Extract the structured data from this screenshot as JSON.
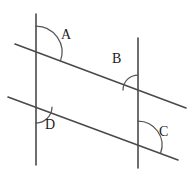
{
  "figure": {
    "kind": "geometry-diagram",
    "width": 193,
    "height": 178,
    "background_color": "#ffffff",
    "line_color": "#4a4a4a",
    "arc_color": "#555555",
    "label_color": "#1a1a1a"
  },
  "lines": [
    {
      "id": "left-vertical",
      "name": "left vertical line",
      "x1": 36,
      "y1": 14,
      "x2": 36,
      "y2": 165
    },
    {
      "id": "right-vertical",
      "name": "right vertical line",
      "x1": 138,
      "y1": 38,
      "x2": 138,
      "y2": 168
    },
    {
      "id": "upper-transversal",
      "name": "upper transversal line",
      "x1": 15,
      "y1": 44,
      "x2": 186,
      "y2": 108
    },
    {
      "id": "lower-transversal",
      "name": "lower transversal line",
      "x1": 8,
      "y1": 97,
      "x2": 178,
      "y2": 160
    }
  ],
  "intersections": [
    {
      "id": "top-left",
      "x": 36,
      "y": 52
    },
    {
      "id": "top-right",
      "x": 138,
      "y": 90
    },
    {
      "id": "bottom-left",
      "x": 36,
      "y": 107
    },
    {
      "id": "bottom-right",
      "x": 138,
      "y": 145
    }
  ],
  "angles": [
    {
      "id": "angle-a",
      "label": "A",
      "at": "top-left",
      "vertex_x": 36,
      "vertex_y": 52,
      "radius": 26,
      "start_deg": -90,
      "end_deg": 20,
      "label_x": 61,
      "label_y": 28
    },
    {
      "id": "angle-b",
      "label": "B",
      "at": "top-right",
      "vertex_x": 138,
      "vertex_y": 90,
      "radius": 15,
      "start_deg": 180,
      "end_deg": 270,
      "label_x": 112,
      "label_y": 52
    },
    {
      "id": "angle-c",
      "label": "C",
      "at": "bottom-right",
      "vertex_x": 138,
      "vertex_y": 145,
      "radius": 24,
      "start_deg": -90,
      "end_deg": 20,
      "label_x": 159,
      "label_y": 125
    },
    {
      "id": "angle-d",
      "label": "D",
      "at": "bottom-left",
      "vertex_x": 36,
      "vertex_y": 107,
      "radius": 16,
      "start_deg": 0,
      "end_deg": 90,
      "label_x": 45,
      "label_y": 118
    }
  ]
}
